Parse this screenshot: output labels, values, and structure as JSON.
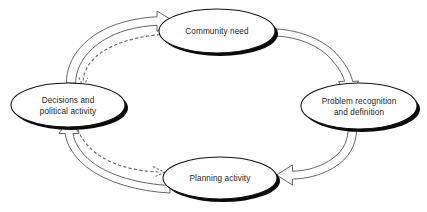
{
  "diagram": {
    "type": "cycle-diagram",
    "background_color": "#ffffff",
    "node_fill": "#ffffff",
    "node_stroke": "#111111",
    "node_shadow_color": "#0a0a0a",
    "arrow_stroke": "#5e5e5e",
    "dashed_arrow_stroke": "#6a6a6a",
    "text_color": "#1c1c1c",
    "nodes": [
      {
        "id": "community-need",
        "label": "Community need",
        "lines": [
          "Community need"
        ],
        "position": "top",
        "cx": 217,
        "cy": 31,
        "rx": 58,
        "ry": 22
      },
      {
        "id": "problem-recognition",
        "label": "Problem recognition and definition",
        "lines": [
          "Problem recognition",
          "and definition"
        ],
        "position": "right",
        "cx": 359,
        "cy": 106,
        "rx": 58,
        "ry": 23
      },
      {
        "id": "planning-activity",
        "label": "Planning activity",
        "lines": [
          "Planning activity"
        ],
        "position": "bottom",
        "cx": 220,
        "cy": 178,
        "rx": 57,
        "ry": 21
      },
      {
        "id": "decisions-political-activity",
        "label": "Decisions and political activity",
        "lines": [
          "Decisions and",
          "political activity"
        ],
        "position": "left",
        "cx": 68,
        "cy": 105,
        "rx": 57,
        "ry": 22
      }
    ],
    "arrows": [
      {
        "id": "decisions-to-community-need",
        "style": "hollow-block",
        "from": "decisions-political-activity",
        "to": "community-need",
        "direction": "clockwise-top-left"
      },
      {
        "id": "community-need-to-problem-recognition",
        "style": "hollow-block",
        "from": "community-need",
        "to": "problem-recognition",
        "direction": "clockwise-top-right"
      },
      {
        "id": "problem-recognition-to-planning-activity",
        "style": "hollow-block",
        "from": "problem-recognition",
        "to": "planning-activity",
        "direction": "clockwise-bottom-right"
      },
      {
        "id": "planning-activity-to-decisions",
        "style": "hollow-block",
        "from": "planning-activity",
        "to": "decisions-political-activity",
        "direction": "clockwise-bottom-left"
      },
      {
        "id": "community-need-to-decisions-feedback",
        "style": "dashed",
        "from": "community-need",
        "to": "decisions-political-activity",
        "direction": "feedback-top-left"
      },
      {
        "id": "decisions-to-planning-activity-feedback",
        "style": "dashed",
        "from": "decisions-political-activity",
        "to": "planning-activity",
        "direction": "feedback-bottom-left"
      }
    ]
  }
}
